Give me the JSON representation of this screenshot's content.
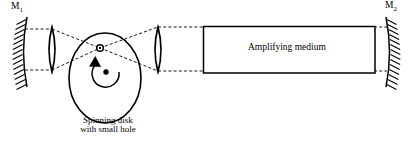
{
  "figure": {
    "type": "optics-diagram",
    "background_color": "#ffffff",
    "stroke_color": "#000000",
    "width": 409,
    "height": 147
  },
  "labels": {
    "mirror_left": {
      "base": "M",
      "subscript": "1",
      "full": "M1"
    },
    "mirror_right": {
      "base": "M",
      "subscript": "2",
      "full": "M2"
    },
    "amplifying_medium": "Amplifying medium",
    "disk_caption_line1": "Spinning disk",
    "disk_caption_line2": "with small hole"
  },
  "components": {
    "mirror_left": {
      "name": "curved-hatched-mirror",
      "cx": 24,
      "top_y": 16,
      "bottom_y": 88,
      "hatch_count": 14,
      "hatch_side": "left"
    },
    "lens_left": {
      "name": "biconvex-lens",
      "cx": 52,
      "top_y": 27,
      "bottom_y": 72,
      "bulge": 5
    },
    "lens_right": {
      "name": "biconvex-lens",
      "cx": 158,
      "top_y": 27,
      "bottom_y": 72,
      "bulge": 5
    },
    "spinning_disk": {
      "name": "ellipse-disk",
      "cx": 105,
      "cy": 78,
      "rx": 36,
      "ry": 45
    },
    "small_hole": {
      "name": "hole-marker",
      "cx": 100,
      "cy": 48,
      "r_outer": 3.2,
      "r_inner": 1.4
    },
    "disk_center_dot": {
      "cx": 106,
      "cy": 72,
      "r": 2.6
    },
    "rotation_arrow": {
      "name": "counterclockwise-rotation-arrow",
      "cx": 106,
      "cy": 72,
      "r": 13,
      "direction": "counterclockwise"
    },
    "amplifying_medium_box": {
      "x": 203,
      "y": 26,
      "width": 172,
      "height": 47
    },
    "mirror_right": {
      "name": "curved-hatched-mirror",
      "cx": 384,
      "top_y": 16,
      "bottom_y": 88,
      "hatch_count": 14,
      "hatch_side": "right"
    }
  },
  "beams": {
    "style": "dashed",
    "dash_pattern": "3,2.2",
    "segments": [
      {
        "name": "upper-left-outer",
        "x1": 25,
        "y1": 29,
        "x2": 52,
        "y2": 29
      },
      {
        "name": "lower-left-outer",
        "x1": 25,
        "y1": 70,
        "x2": 52,
        "y2": 70
      },
      {
        "name": "upper-left-to-hole",
        "x1": 52,
        "y1": 29,
        "x2": 100,
        "y2": 48
      },
      {
        "name": "lower-left-to-hole",
        "x1": 52,
        "y1": 70,
        "x2": 100,
        "y2": 48
      },
      {
        "name": "hole-to-upper-right",
        "x1": 100,
        "y1": 48,
        "x2": 158,
        "y2": 27
      },
      {
        "name": "hole-to-lower-right",
        "x1": 100,
        "y1": 48,
        "x2": 158,
        "y2": 71
      },
      {
        "name": "upper-right-outer",
        "x1": 158,
        "y1": 27,
        "x2": 203,
        "y2": 27
      },
      {
        "name": "lower-right-outer",
        "x1": 158,
        "y1": 71,
        "x2": 203,
        "y2": 71
      },
      {
        "name": "upper-medium-to-m2",
        "x1": 375,
        "y1": 27,
        "x2": 386,
        "y2": 27
      },
      {
        "name": "lower-medium-to-m2",
        "x1": 375,
        "y1": 71,
        "x2": 386,
        "y2": 71
      }
    ]
  }
}
